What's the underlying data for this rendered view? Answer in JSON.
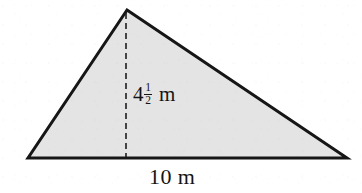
{
  "figure": {
    "kind": "shaded-triangle-with-altitude",
    "fill_color": "#e4e4e4",
    "stroke_color": "#161616",
    "background_color": "#ffffff",
    "stroke_width": 3,
    "dash_color": "#1d1d1d",
    "dash_width": 1.6,
    "dash_pattern": "6 4",
    "vertices": {
      "apex": {
        "x": 127,
        "y": 10
      },
      "base_left": {
        "x": 28,
        "y": 158
      },
      "base_right": {
        "x": 347,
        "y": 158
      }
    },
    "altitude": {
      "from": {
        "x": 126,
        "y": 13
      },
      "to": {
        "x": 126,
        "y": 157
      }
    }
  },
  "labels": {
    "height": {
      "text": "4 1/2 m",
      "whole": "4",
      "numerator": "1",
      "denominator": "2",
      "unit": "m"
    },
    "base": {
      "text": "10 m",
      "value": "10",
      "unit": "m"
    }
  },
  "chart_data": {
    "type": "diagram",
    "shape": "triangle",
    "title": "",
    "measurements": [
      {
        "name": "base",
        "label": "10 m",
        "value": 10,
        "unit": "m"
      },
      {
        "name": "height",
        "label": "4 1/2 m",
        "value": 4.5,
        "unit": "m"
      }
    ],
    "annotations": [
      "10 m",
      "4 1/2 m"
    ]
  }
}
